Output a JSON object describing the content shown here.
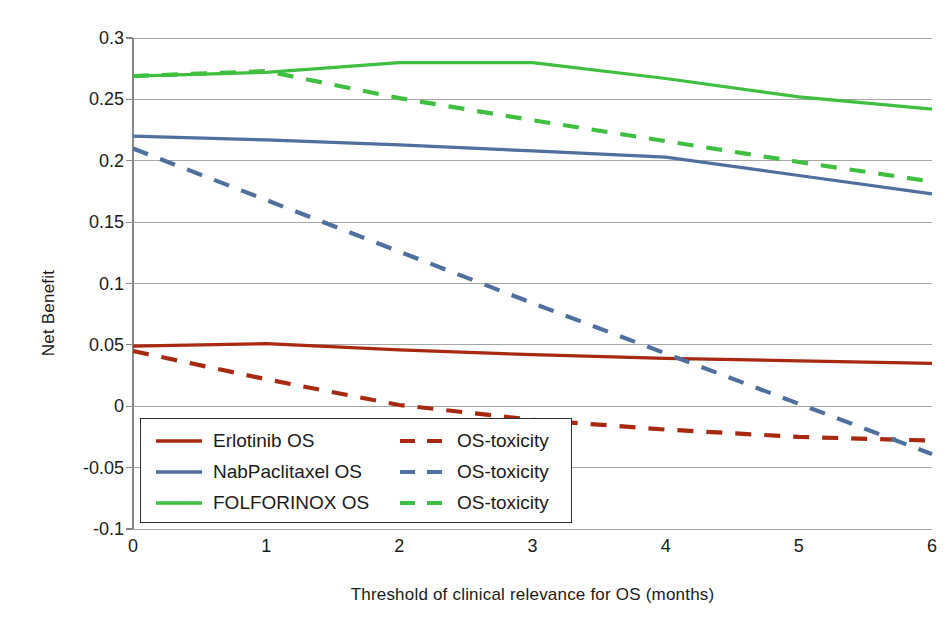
{
  "chart_data": {
    "type": "line",
    "title": "",
    "xlabel": "Threshold of clinical relevance for OS (months)",
    "ylabel": "Net Benefit",
    "xlim": [
      0,
      6
    ],
    "ylim": [
      -0.1,
      0.3
    ],
    "grid": true,
    "legend_position": "inside-bottom-left",
    "x": [
      0,
      1,
      2,
      3,
      4,
      5,
      6
    ],
    "xticks": [
      "0",
      "1",
      "2",
      "3",
      "4",
      "5",
      "6"
    ],
    "yticks": [
      "0.3",
      "0.25",
      "0.2",
      "0.15",
      "0.1",
      "0.05",
      "0",
      "-0.05",
      "-0.1"
    ],
    "ytick_values": [
      0.3,
      0.25,
      0.2,
      0.15,
      0.1,
      0.05,
      0,
      -0.05,
      -0.1
    ],
    "series": [
      {
        "name": "Erlotinib OS",
        "style": "solid",
        "color": "#A82810",
        "values": [
          0.049,
          0.051,
          0.046,
          0.042,
          0.039,
          0.037,
          0.035
        ]
      },
      {
        "name": "OS-toxicity",
        "group": "Erlotinib",
        "style": "dashed",
        "color": "#A82810",
        "values": [
          0.045,
          0.022,
          0.001,
          -0.011,
          -0.019,
          -0.025,
          -0.028
        ]
      },
      {
        "name": "NabPaclitaxel OS",
        "style": "solid",
        "color": "#4F6F9F",
        "values": [
          0.22,
          0.217,
          0.213,
          0.208,
          0.203,
          0.188,
          0.173
        ]
      },
      {
        "name": "OS-toxicity",
        "group": "NabPaclitaxel",
        "style": "dashed",
        "color": "#4F6F9F",
        "values": [
          0.21,
          0.168,
          0.126,
          0.084,
          0.043,
          0.002,
          -0.039
        ]
      },
      {
        "name": "FOLFORINOX OS",
        "style": "solid",
        "color": "#3FBF3F",
        "values": [
          0.269,
          0.272,
          0.28,
          0.28,
          0.267,
          0.252,
          0.242
        ]
      },
      {
        "name": "OS-toxicity",
        "group": "FOLFORINOX",
        "style": "dashed",
        "color": "#3FBF3F",
        "values": [
          0.269,
          0.273,
          0.251,
          0.233,
          0.216,
          0.199,
          0.183
        ]
      }
    ]
  },
  "legend": {
    "rows": [
      {
        "solid_label": "Erlotinib OS",
        "dashed_label": "OS-toxicity",
        "color": "#A82810"
      },
      {
        "solid_label": "NabPaclitaxel OS",
        "dashed_label": "OS-toxicity",
        "color": "#4F6F9F"
      },
      {
        "solid_label": "FOLFORINOX OS",
        "dashed_label": "OS-toxicity",
        "color": "#3FBF3F"
      }
    ]
  },
  "axes": {
    "grid_color": "#A6A6A6",
    "axis_color": "#868686"
  }
}
